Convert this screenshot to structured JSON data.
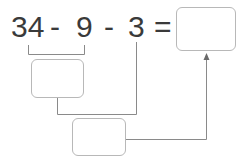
{
  "expression": {
    "tokens": [
      "34",
      "-",
      "9",
      "-",
      "3",
      "="
    ],
    "text": "34 - 9 - 3 ="
  },
  "boxes": {
    "answer": {
      "value": ""
    },
    "step1": {
      "value": ""
    },
    "step2": {
      "value": ""
    }
  },
  "colors": {
    "text": "#3a3a3a",
    "line": "#8a8a8a",
    "box_border": "#b8b8b8"
  }
}
